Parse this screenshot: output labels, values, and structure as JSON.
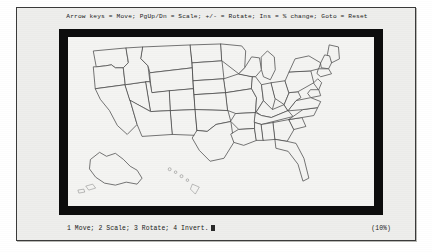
{
  "window": {
    "shortcut_hint": "Arrow keys = Move; PgUp/Dn = Scale; +/- = Rotate; Ins = % change; Goto = Reset"
  },
  "status": {
    "modes": "1 Move; 2 Scale; 3 Rotate; 4 Invert.",
    "scale": "(10%)"
  },
  "map": {
    "title": "United States state outline map",
    "region_names": [
      "Contiguous United States",
      "Alaska",
      "Hawaii"
    ]
  },
  "colors": {
    "paper": "#eeeeec",
    "viewport_border": "#0d0d0d",
    "map_canvas": "#f4f4f2",
    "map_stroke": "#4a4a4a",
    "text": "#1a1a1a"
  }
}
